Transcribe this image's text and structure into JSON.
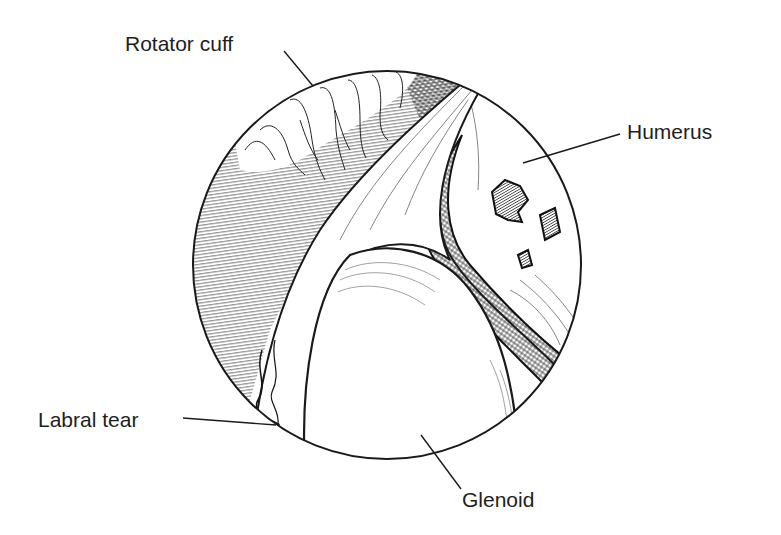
{
  "figure": {
    "type": "arthroscopic view illustration",
    "labels": [
      {
        "id": "rotator-cuff",
        "text": "Rotator cuff"
      },
      {
        "id": "humerus",
        "text": "Humerus"
      },
      {
        "id": "labral-tear",
        "text": "Labral tear"
      },
      {
        "id": "glenoid",
        "text": "Glenoid"
      }
    ]
  },
  "colors": {
    "ink": "#1e1e1e",
    "background": "#ffffff"
  }
}
